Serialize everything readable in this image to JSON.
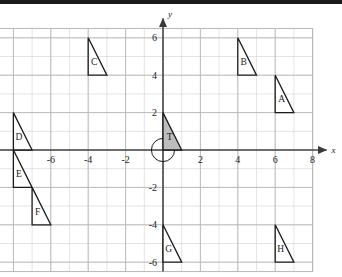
{
  "figure": {
    "axis_labels": {
      "x": "x",
      "y": "y"
    },
    "x_tick_labels": [
      "-6",
      "-4",
      "-2",
      "2",
      "4",
      "6",
      "8"
    ],
    "y_tick_labels": [
      "6",
      "4",
      "2",
      "-2",
      "-4",
      "-6"
    ],
    "colors": {
      "grid_minor": "#d8d8d8",
      "grid_major": "#b8b8b8",
      "axis": "#4a4a4a",
      "shape_stroke": "#1a1a1a",
      "shape_fill_shaded": "#bdbdbd",
      "shape_fill_plain": "#ffffff",
      "text": "#1a1a1a"
    }
  },
  "chart_data": {
    "type": "scatter",
    "xlabel": "x",
    "ylabel": "y",
    "xlim": [
      -9,
      8
    ],
    "ylim": [
      -6.5,
      6.5
    ],
    "grid": true,
    "grid_minor_step": 1,
    "grid_major_step": 2,
    "legend": "none",
    "xticks": [
      -6,
      -4,
      -2,
      2,
      4,
      6,
      8
    ],
    "yticks": [
      6,
      4,
      2,
      -2,
      -4,
      -6
    ],
    "xtick_labels": [
      "-6",
      "-4",
      "-2",
      "2",
      "4",
      "6",
      "8"
    ],
    "ytick_labels": [
      "6",
      "4",
      "2",
      "-2",
      "-4",
      "-6"
    ],
    "annotations": [
      {
        "name": "origin-circle",
        "shape": "circle",
        "center": [
          0,
          0
        ],
        "radius": 1,
        "fill": "none"
      }
    ],
    "shapes": [
      {
        "label": "T",
        "type": "right-triangle",
        "vertices": [
          [
            0,
            2
          ],
          [
            0,
            0
          ],
          [
            1,
            0
          ]
        ],
        "fill": "shaded",
        "label_pos": [
          0.35,
          0.55
        ]
      },
      {
        "label": "A",
        "type": "right-triangle",
        "vertices": [
          [
            6,
            4
          ],
          [
            6,
            2
          ],
          [
            7,
            2
          ]
        ],
        "fill": "plain",
        "label_pos": [
          6.35,
          2.55
        ]
      },
      {
        "label": "B",
        "type": "right-triangle",
        "vertices": [
          [
            4,
            6
          ],
          [
            4,
            4
          ],
          [
            5,
            4
          ]
        ],
        "fill": "plain",
        "label_pos": [
          4.32,
          4.55
        ]
      },
      {
        "label": "C",
        "type": "right-triangle",
        "vertices": [
          [
            -4,
            6
          ],
          [
            -4,
            4
          ],
          [
            -3,
            4
          ]
        ],
        "fill": "plain",
        "label_pos": [
          -3.68,
          4.55
        ]
      },
      {
        "label": "D",
        "type": "right-triangle",
        "vertices": [
          [
            -8,
            2
          ],
          [
            -8,
            0
          ],
          [
            -7,
            0
          ]
        ],
        "fill": "plain",
        "label_pos": [
          -7.7,
          0.55
        ]
      },
      {
        "label": "E",
        "type": "right-triangle",
        "vertices": [
          [
            -8,
            0
          ],
          [
            -8,
            -2
          ],
          [
            -7,
            -2
          ]
        ],
        "fill": "plain",
        "label_pos": [
          -7.7,
          -1.45
        ]
      },
      {
        "label": "F",
        "type": "right-triangle",
        "vertices": [
          [
            -7,
            -2
          ],
          [
            -7,
            -4
          ],
          [
            -6,
            -4
          ]
        ],
        "fill": "plain",
        "label_pos": [
          -6.7,
          -3.45
        ]
      },
      {
        "label": "G",
        "type": "right-triangle",
        "vertices": [
          [
            0,
            -4
          ],
          [
            0,
            -6
          ],
          [
            1,
            -6
          ]
        ],
        "fill": "plain",
        "label_pos": [
          0.3,
          -5.45
        ]
      },
      {
        "label": "H",
        "type": "right-triangle",
        "vertices": [
          [
            6,
            -4
          ],
          [
            6,
            -6
          ],
          [
            7,
            -6
          ]
        ],
        "fill": "plain",
        "label_pos": [
          6.3,
          -5.45
        ]
      }
    ]
  }
}
